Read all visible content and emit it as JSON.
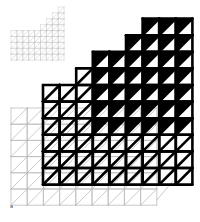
{
  "figure": {
    "corner_label": "a",
    "colors": {
      "background": "#ffffff",
      "ink": "#000000",
      "thin": "#bdbdbd",
      "faint": "#c8c8c8"
    }
  },
  "grids": [
    {
      "name": "small-faint-grid",
      "x0": 11,
      "y0": 7,
      "cell": 5.9,
      "cols": 9,
      "rows": 9,
      "stroke": "#c8c8c8",
      "width": 0.6,
      "chamfer_cols": 3
    },
    {
      "name": "thin-grid",
      "x0": 11,
      "y0": 108,
      "cell": 16.2,
      "cols": 9,
      "rows": 6,
      "stroke": "#bdbdbd",
      "width": 0.8
    },
    {
      "name": "thick-grid",
      "x0": 43,
      "y0": 85,
      "cell": 16.6,
      "cols": 9,
      "rows": 6,
      "stroke": "#000000",
      "width": 2.6
    }
  ]
}
